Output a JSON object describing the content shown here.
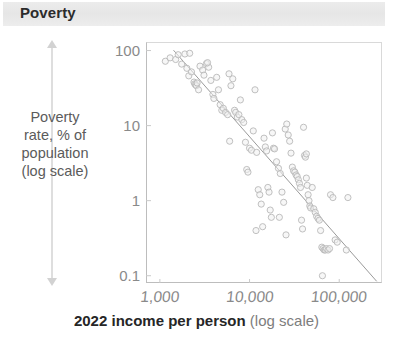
{
  "header": {
    "title": "Poverty",
    "banner_color": "#eaeaea"
  },
  "y_axis": {
    "caption_lines": [
      "Poverty",
      "rate, % of",
      "population",
      "(log scale)"
    ],
    "caption_full": "Poverty rate, % of population (log scale)",
    "arrow_up_icon": "arrow-up-icon",
    "arrow_down_icon": "arrow-down-icon"
  },
  "x_axis": {
    "title_strong": "2022 income per person",
    "title_muted": "(log scale)"
  },
  "colors": {
    "title_text": "#2b2b2b",
    "tick_text": "#8a8a8a",
    "caption_text": "#5b5b5b",
    "point_stroke": "#b9b9b9",
    "point_fill": "#f0f0f0",
    "trend_line": "#9a9a9a",
    "frame": "#c9c9c9",
    "banner": "#eaeaea"
  },
  "chart_data": {
    "type": "scatter",
    "title": "Poverty",
    "xlabel": "2022 income per person (log scale)",
    "ylabel": "Poverty rate, % of population (log scale)",
    "x_scale": "log",
    "y_scale": "log",
    "xlim": [
      700,
      300000
    ],
    "ylim": [
      0.08,
      130
    ],
    "xticks": [
      1000,
      10000,
      100000
    ],
    "xtick_labels": [
      "1,000",
      "10,000",
      "100,000"
    ],
    "yticks": [
      0.1,
      1,
      10,
      100
    ],
    "ytick_labels": [
      "0.1",
      "1",
      "10",
      "100"
    ],
    "grid": false,
    "legend": null,
    "marker": "open-circle",
    "trend_line": {
      "present": true,
      "description": "downward log-log regression line",
      "x_start": 1430,
      "y_start": 100,
      "x_end": 260000,
      "y_end": 0.085
    },
    "points": [
      {
        "x": 1150,
        "y": 72
      },
      {
        "x": 1300,
        "y": 80
      },
      {
        "x": 1500,
        "y": 76
      },
      {
        "x": 1600,
        "y": 88
      },
      {
        "x": 1750,
        "y": 66
      },
      {
        "x": 1900,
        "y": 90
      },
      {
        "x": 2000,
        "y": 58
      },
      {
        "x": 2100,
        "y": 46
      },
      {
        "x": 2250,
        "y": 52
      },
      {
        "x": 2400,
        "y": 38
      },
      {
        "x": 2450,
        "y": 36
      },
      {
        "x": 2500,
        "y": 35
      },
      {
        "x": 2550,
        "y": 34
      },
      {
        "x": 2600,
        "y": 37
      },
      {
        "x": 2700,
        "y": 30
      },
      {
        "x": 2800,
        "y": 62
      },
      {
        "x": 3000,
        "y": 55
      },
      {
        "x": 3100,
        "y": 47
      },
      {
        "x": 3300,
        "y": 67
      },
      {
        "x": 3500,
        "y": 60
      },
      {
        "x": 3700,
        "y": 40
      },
      {
        "x": 3900,
        "y": 26
      },
      {
        "x": 4000,
        "y": 23
      },
      {
        "x": 4300,
        "y": 44
      },
      {
        "x": 4500,
        "y": 30
      },
      {
        "x": 4700,
        "y": 19
      },
      {
        "x": 4900,
        "y": 16
      },
      {
        "x": 5100,
        "y": 17
      },
      {
        "x": 5400,
        "y": 15
      },
      {
        "x": 5700,
        "y": 14
      },
      {
        "x": 5900,
        "y": 49
      },
      {
        "x": 6200,
        "y": 34
      },
      {
        "x": 6500,
        "y": 42
      },
      {
        "x": 6800,
        "y": 16
      },
      {
        "x": 7000,
        "y": 15
      },
      {
        "x": 7300,
        "y": 13
      },
      {
        "x": 7600,
        "y": 14
      },
      {
        "x": 7900,
        "y": 22
      },
      {
        "x": 8200,
        "y": 12
      },
      {
        "x": 8600,
        "y": 11
      },
      {
        "x": 9000,
        "y": 6.0
      },
      {
        "x": 9300,
        "y": 2.6
      },
      {
        "x": 9600,
        "y": 2.4
      },
      {
        "x": 10000,
        "y": 5.0
      },
      {
        "x": 10500,
        "y": 4.7
      },
      {
        "x": 11000,
        "y": 8.5
      },
      {
        "x": 11500,
        "y": 30
      },
      {
        "x": 12000,
        "y": 4.4
      },
      {
        "x": 12500,
        "y": 1.4
      },
      {
        "x": 13000,
        "y": 1.2
      },
      {
        "x": 13500,
        "y": 0.9
      },
      {
        "x": 14000,
        "y": 0.45
      },
      {
        "x": 14500,
        "y": 6.8
      },
      {
        "x": 15000,
        "y": 5.2
      },
      {
        "x": 15500,
        "y": 4.6
      },
      {
        "x": 16000,
        "y": 1.5
      },
      {
        "x": 16500,
        "y": 1.3
      },
      {
        "x": 17000,
        "y": 0.75
      },
      {
        "x": 17500,
        "y": 0.6
      },
      {
        "x": 18000,
        "y": 8.0
      },
      {
        "x": 18500,
        "y": 5.0
      },
      {
        "x": 19000,
        "y": 4.9
      },
      {
        "x": 20000,
        "y": 3.3
      },
      {
        "x": 21000,
        "y": 2.7
      },
      {
        "x": 22000,
        "y": 2.3
      },
      {
        "x": 23000,
        "y": 1.3
      },
      {
        "x": 24000,
        "y": 0.95
      },
      {
        "x": 25000,
        "y": 9.0
      },
      {
        "x": 26000,
        "y": 10.5
      },
      {
        "x": 27000,
        "y": 7.5
      },
      {
        "x": 28000,
        "y": 6.2
      },
      {
        "x": 29000,
        "y": 4.3
      },
      {
        "x": 30000,
        "y": 2.8
      },
      {
        "x": 31000,
        "y": 2.5
      },
      {
        "x": 32000,
        "y": 2.4
      },
      {
        "x": 33000,
        "y": 2.2
      },
      {
        "x": 34000,
        "y": 2.1
      },
      {
        "x": 35000,
        "y": 1.9
      },
      {
        "x": 36000,
        "y": 1.7
      },
      {
        "x": 37000,
        "y": 1.5
      },
      {
        "x": 38000,
        "y": 0.55
      },
      {
        "x": 39000,
        "y": 0.42
      },
      {
        "x": 40000,
        "y": 9.5
      },
      {
        "x": 41000,
        "y": 4.0
      },
      {
        "x": 42000,
        "y": 3.8
      },
      {
        "x": 43000,
        "y": 2.0
      },
      {
        "x": 44000,
        "y": 1.6
      },
      {
        "x": 45000,
        "y": 1.2
      },
      {
        "x": 46000,
        "y": 1.0
      },
      {
        "x": 47000,
        "y": 0.85
      },
      {
        "x": 48000,
        "y": 0.8
      },
      {
        "x": 50000,
        "y": 1.5
      },
      {
        "x": 52000,
        "y": 0.78
      },
      {
        "x": 54000,
        "y": 0.7
      },
      {
        "x": 56000,
        "y": 0.62
      },
      {
        "x": 58000,
        "y": 0.58
      },
      {
        "x": 60000,
        "y": 0.55
      },
      {
        "x": 62000,
        "y": 0.4
      },
      {
        "x": 64000,
        "y": 0.24
      },
      {
        "x": 66000,
        "y": 0.23
      },
      {
        "x": 68000,
        "y": 0.22
      },
      {
        "x": 70000,
        "y": 0.22
      },
      {
        "x": 72000,
        "y": 0.23
      },
      {
        "x": 75000,
        "y": 0.22
      },
      {
        "x": 78000,
        "y": 0.23
      },
      {
        "x": 80000,
        "y": 1.2
      },
      {
        "x": 85000,
        "y": 1.1
      },
      {
        "x": 90000,
        "y": 0.3
      },
      {
        "x": 95000,
        "y": 0.28
      },
      {
        "x": 120000,
        "y": 0.22
      },
      {
        "x": 125000,
        "y": 1.1
      },
      {
        "x": 65000,
        "y": 0.1
      },
      {
        "x": 25500,
        "y": 0.35
      },
      {
        "x": 21500,
        "y": 0.6
      },
      {
        "x": 11800,
        "y": 0.4
      },
      {
        "x": 6000,
        "y": 6.2
      },
      {
        "x": 43000,
        "y": 4.2
      },
      {
        "x": 3400,
        "y": 69
      },
      {
        "x": 2150,
        "y": 92
      }
    ]
  }
}
